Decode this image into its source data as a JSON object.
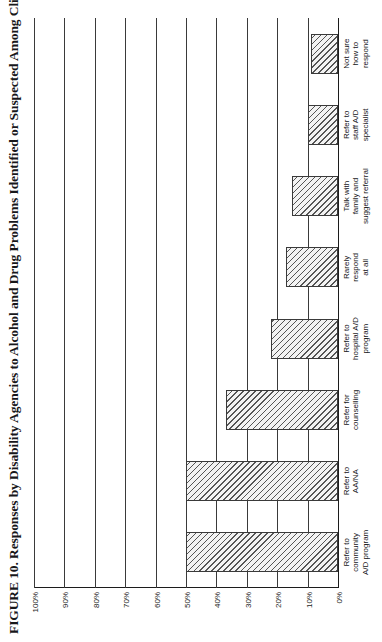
{
  "figure": {
    "title": "FIGURE 10. Responses by Disability Agencies to Alcohol and Drug Problems Identified or Suspected Among Clients"
  },
  "axis": {
    "y_ticks": [
      "100%",
      "90%",
      "80%",
      "70%",
      "60%",
      "50%",
      "40%",
      "30%",
      "20%",
      "10%",
      "0%"
    ]
  },
  "categories": [
    {
      "line1": "Refer to",
      "line2": "community",
      "line3": "A/D program"
    },
    {
      "line1": "Refer to",
      "line2": "AA/NA",
      "line3": ""
    },
    {
      "line1": "Refer for",
      "line2": "counselling",
      "line3": ""
    },
    {
      "line1": "Refer to",
      "line2": "hospital A/D",
      "line3": "program"
    },
    {
      "line1": "Rarely",
      "line2": "respond",
      "line3": "at all"
    },
    {
      "line1": "Talk with",
      "line2": "family and",
      "line3": "suggest referral"
    },
    {
      "line1": "Refer to",
      "line2": "staff A/D",
      "line3": "specialist"
    },
    {
      "line1": "Not sure",
      "line2": "how to",
      "line3": "respond"
    }
  ],
  "chart_data": {
    "type": "bar",
    "title": "FIGURE 10. Responses by Disability Agencies to Alcohol and Drug Problems Identified or Suspected Among Clients",
    "xlabel": "",
    "ylabel": "",
    "ylim": [
      0,
      100
    ],
    "ytick_step": 10,
    "grid": true,
    "legend": "none",
    "orientation": "horizontal-bars-on-rotated-page",
    "categories": [
      "Refer to community A/D program",
      "Refer to AA/NA",
      "Refer for counselling",
      "Refer to hospital A/D program",
      "Rarely respond at all",
      "Talk with family and suggest referral",
      "Refer to staff A/D specialist",
      "Not sure how to respond"
    ],
    "values": [
      50,
      50,
      37,
      22,
      17,
      15,
      10,
      9
    ],
    "units": "percent"
  },
  "style": {
    "bar_fill": "#f3f3f3",
    "bar_hatch": "#555555",
    "bar_border": "#3a3a3a",
    "axis_color": "#1c1c1c",
    "text_color": "#16161a",
    "background": "#ffffff"
  }
}
